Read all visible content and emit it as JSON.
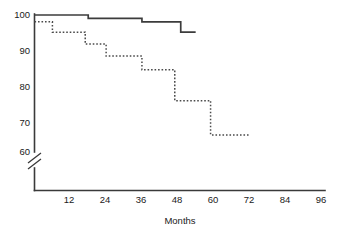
{
  "chart_data": {
    "type": "line",
    "title": "",
    "subtitle": "",
    "xlabel": "Months",
    "ylabel": "",
    "xlim": [
      0,
      96
    ],
    "ylim": [
      60,
      100
    ],
    "y_axis_break": true,
    "y_break_note": "axis broken below 60",
    "grid": false,
    "legend": "none",
    "xticks": [
      12,
      24,
      36,
      48,
      60,
      72,
      84,
      96
    ],
    "xtick_labels": [
      "12",
      "24",
      "36",
      "48",
      "60",
      "72",
      "84",
      "96"
    ],
    "yticks": [
      60,
      70,
      80,
      90,
      100
    ],
    "ytick_labels": [
      "60",
      "70",
      "80",
      "90",
      "100"
    ],
    "series": [
      {
        "name": "solid-curve",
        "style": "solid",
        "color": "#3c3c3c",
        "step": "post",
        "x": [
          0,
          18,
          18,
          36,
          36,
          49,
          49,
          54
        ],
        "y": [
          100,
          100,
          99,
          99,
          98,
          98,
          95,
          95
        ]
      },
      {
        "name": "dotted-curve",
        "style": "dotted",
        "color": "#4a4a4a",
        "step": "post",
        "x": [
          0,
          6,
          6,
          17,
          17,
          24,
          24,
          36,
          36,
          47,
          47,
          59,
          59,
          72
        ],
        "y": [
          98,
          98,
          95,
          95,
          91.5,
          91.5,
          88,
          88,
          84,
          84,
          75,
          75,
          65,
          65
        ]
      }
    ]
  },
  "axis_title": {
    "x": "Months"
  }
}
